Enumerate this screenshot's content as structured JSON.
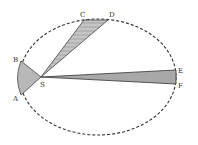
{
  "diagram": {
    "orbit": {
      "cx": 98,
      "cy": 77,
      "rx": 78,
      "ry": 58,
      "style": "dashed",
      "color": "#333333"
    },
    "focus": {
      "label": "S",
      "x": 41,
      "y": 77
    },
    "sectors": [
      {
        "id": "AB",
        "points": [
          "A",
          "B"
        ],
        "fill": "#b8b8b8"
      },
      {
        "id": "CD",
        "points": [
          "C",
          "D"
        ],
        "fill": "#b8b8b8",
        "hatched": true
      },
      {
        "id": "EF",
        "points": [
          "E",
          "F"
        ],
        "fill": "#a8a8a8"
      }
    ],
    "points": {
      "A": {
        "x": 21,
        "y": 95,
        "label": "A"
      },
      "B": {
        "x": 21,
        "y": 61,
        "label": "B"
      },
      "C": {
        "x": 84,
        "y": 20,
        "label": "C"
      },
      "D": {
        "x": 108,
        "y": 20,
        "label": "D"
      },
      "E": {
        "x": 176,
        "y": 70,
        "label": "E"
      },
      "F": {
        "x": 176,
        "y": 84,
        "label": "F"
      }
    },
    "labels": {
      "A": "A",
      "B": "B",
      "C": "C",
      "D": "D",
      "E": "E",
      "F": "F",
      "S": "S"
    }
  }
}
